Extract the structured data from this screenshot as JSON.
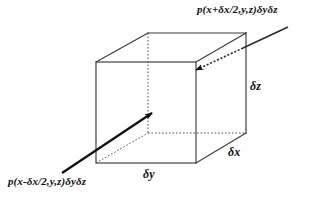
{
  "figure": {
    "background_color": "#fefefe",
    "line_color": "#3a3a3a",
    "arrow_color": "#111111",
    "labels": {
      "pressure_plus": "p(x+δx/2,y,z)δyδz",
      "pressure_minus": "p(x-δx/2,y,z)δyδz",
      "dim_z": "δz",
      "dim_x": "δx",
      "dim_y": "δy"
    }
  },
  "geometry": {
    "front_face": {
      "top_left": [
        96,
        62
      ],
      "top_right": [
        196,
        62
      ],
      "bottom_right": [
        196,
        163
      ],
      "bottom_left": [
        96,
        163
      ]
    },
    "back_face": {
      "top_left": [
        148,
        33
      ],
      "top_right": [
        246,
        33
      ],
      "bottom_right": [
        246,
        133
      ],
      "bottom_left": [
        148,
        133
      ]
    },
    "hidden_edges": [
      "back-top-left to back-bottom-left",
      "back-bottom-left to back-bottom-right",
      "front-bottom-left to back-bottom-left"
    ]
  },
  "arrows": {
    "incoming_left": {
      "from": [
        62,
        173
      ],
      "to": [
        156,
        111
      ],
      "style": "solid",
      "head": "filled"
    },
    "incoming_right": {
      "from": [
        288,
        27
      ],
      "to": [
        192,
        73
      ],
      "style": "solid-then-dotted",
      "head": "filled"
    }
  }
}
